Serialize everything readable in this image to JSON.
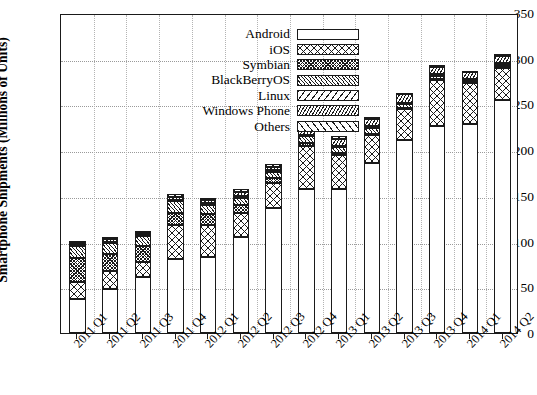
{
  "chart_data": {
    "type": "bar",
    "subtype": "stacked-bar",
    "title": "",
    "xlabel": "",
    "ylabel": "Smartphone Shipments (Millions of Units)",
    "ylim": [
      0,
      350
    ],
    "yticks": [
      0,
      50,
      100,
      150,
      200,
      250,
      300,
      350
    ],
    "grid": true,
    "legend_position": "top-center-inside",
    "categories": [
      "2011 Q1",
      "2011 Q2",
      "2011 Q3",
      "2011 Q4",
      "2012 Q1",
      "2012 Q2",
      "2012 Q3",
      "2012 Q4",
      "2013 Q1",
      "2013 Q2",
      "2013 Q3",
      "2013 Q4",
      "2014 Q1",
      "2014 Q2"
    ],
    "series": [
      {
        "name": "Android",
        "pattern": "blank",
        "values": [
          37,
          48,
          61,
          81,
          83,
          105,
          137,
          157,
          157,
          186,
          211,
          226,
          229,
          255
        ]
      },
      {
        "name": "iOS",
        "pattern": "crosshatch",
        "values": [
          19,
          20,
          17,
          37,
          35,
          26,
          27,
          48,
          38,
          31,
          34,
          51,
          44,
          35
        ]
      },
      {
        "name": "Symbian",
        "pattern": "dense-crosshatch",
        "values": [
          26,
          18,
          17,
          13,
          12,
          9,
          5,
          3,
          2,
          1,
          1,
          1,
          1,
          1
        ]
      },
      {
        "name": "BlackBerryOS",
        "pattern": "fine-diagonal",
        "values": [
          13,
          12,
          11,
          13,
          10,
          8,
          7,
          7,
          6,
          6,
          4,
          3,
          2,
          2
        ]
      },
      {
        "name": "Linux",
        "pattern": "wide-diagonal",
        "values": [
          2,
          2,
          2,
          2,
          2,
          2,
          2,
          2,
          2,
          2,
          2,
          2,
          2,
          2
        ]
      },
      {
        "name": "Windows Phone",
        "pattern": "dense-diagonal",
        "values": [
          2,
          3,
          2,
          3,
          3,
          4,
          4,
          6,
          7,
          8,
          9,
          8,
          7,
          8
        ]
      },
      {
        "name": "Others",
        "pattern": "coarse-diagonal",
        "values": [
          2,
          2,
          2,
          3,
          3,
          3,
          3,
          3,
          3,
          2,
          2,
          2,
          2,
          2
        ]
      }
    ],
    "totals": [
      101,
      105,
      112,
      152,
      148,
      157,
      185,
      226,
      215,
      236,
      263,
      293,
      287,
      303
    ]
  },
  "legend": {
    "items": [
      {
        "label": "Android"
      },
      {
        "label": "iOS"
      },
      {
        "label": "Symbian"
      },
      {
        "label": "BlackBerryOS"
      },
      {
        "label": "Linux"
      },
      {
        "label": "Windows Phone"
      },
      {
        "label": "Others"
      }
    ]
  },
  "colors": {
    "ink": "#1a1a1a",
    "grid": "#9a9a9a",
    "background": "#ffffff"
  }
}
